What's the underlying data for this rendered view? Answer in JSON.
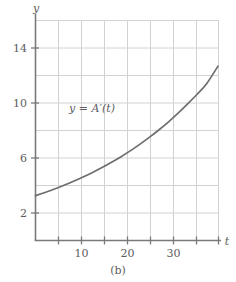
{
  "figure": {
    "caption": "(b)",
    "background_color": "#ffffff"
  },
  "chart_data": {
    "type": "line",
    "title": "",
    "subtitle": "",
    "xlabel": "t",
    "ylabel": "y",
    "xlim": [
      0,
      38.5
    ],
    "ylim": [
      0,
      17.2
    ],
    "grid": true,
    "grid_color": "#d2d2d2",
    "axis_color": "#7a7a7a",
    "curve_color": "#6e6e6e",
    "legend_position": "inline-annotation",
    "x_ticks": [
      10,
      20,
      30
    ],
    "x_tick_labels": [
      "10",
      "20",
      "30"
    ],
    "x_gridlines": [
      4.8,
      9.6,
      14.4,
      19.2,
      24.0,
      28.8,
      33.6,
      38.4
    ],
    "y_ticks": [
      2,
      6,
      10,
      14
    ],
    "y_tick_labels": [
      "2",
      "6",
      "10",
      "14"
    ],
    "y_gridlines": [
      2,
      4,
      6,
      8,
      10,
      12,
      14,
      16
    ],
    "annotations": [
      {
        "text": "y = A′(t)",
        "x": 14.0,
        "y": 10.9
      }
    ],
    "series": [
      {
        "name": "y = A′(t)",
        "color": "#6e6e6e",
        "x": [
          0,
          2,
          4,
          6,
          8,
          10,
          12,
          14,
          16,
          18,
          20,
          22,
          24,
          26,
          28,
          30,
          32,
          34,
          36,
          38.4
        ],
        "values": [
          3.5,
          3.75,
          4.02,
          4.31,
          4.62,
          4.95,
          5.31,
          5.69,
          6.1,
          6.54,
          7.01,
          7.52,
          8.06,
          8.64,
          9.26,
          9.93,
          10.65,
          11.41,
          12.23,
          13.6
        ]
      }
    ]
  }
}
